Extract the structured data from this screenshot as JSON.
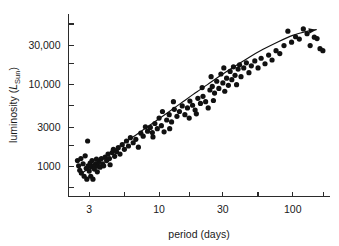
{
  "chart_data": {
    "type": "scatter",
    "title": "",
    "xlabel": "period (days)",
    "ylabel": "luminosity (L_Sun)",
    "ylabel_parts": {
      "prefix": "luminosity (",
      "symbol": "L",
      "subscript": "Sun",
      "suffix": ")"
    },
    "xscale": "log",
    "yscale": "log",
    "xlim": [
      2.1,
      190
    ],
    "ylim": [
      430,
      74000
    ],
    "grid": false,
    "legend": null,
    "xticks": [
      3,
      10,
      30,
      100
    ],
    "xtick_labels": [
      "3",
      "10",
      "30",
      "100"
    ],
    "xminor_ticks": [
      5.5,
      17,
      55,
      170
    ],
    "yticks": [
      1000,
      3000,
      10000,
      30000
    ],
    "ytick_labels": [
      "1000",
      "3000",
      "10,000",
      "30,000"
    ],
    "yminor_ticks": [
      550,
      1800,
      5500,
      18000,
      55000
    ],
    "marker": "filled-circle",
    "marker_color": "#111111",
    "marker_radius_px": 2.6,
    "annotation": "period-luminosity relation for Cepheid variable stars",
    "fit_curve": {
      "style": "solid-line-with-arrowhead",
      "color": "#111111",
      "points": [
        [
          2.55,
          800
        ],
        [
          3.0,
          950
        ],
        [
          3.6,
          1180
        ],
        [
          4.4,
          1500
        ],
        [
          5.5,
          1950
        ],
        [
          7.0,
          2550
        ],
        [
          9.0,
          3400
        ],
        [
          11.5,
          4500
        ],
        [
          14.5,
          5900
        ],
        [
          18.0,
          7600
        ],
        [
          23.0,
          10000
        ],
        [
          29.0,
          13000
        ],
        [
          37.0,
          16800
        ],
        [
          47.0,
          21500
        ],
        [
          60.0,
          27000
        ],
        [
          78.0,
          33500
        ],
        [
          100.0,
          40000
        ],
        [
          125.0,
          44500
        ],
        [
          150.0,
          47000
        ]
      ]
    },
    "points": [
      [
        2.45,
        1180
      ],
      [
        2.5,
        1020
      ],
      [
        2.55,
        900
      ],
      [
        2.6,
        1250
      ],
      [
        2.62,
        830
      ],
      [
        2.7,
        1080
      ],
      [
        2.75,
        760
      ],
      [
        2.8,
        1350
      ],
      [
        2.85,
        950
      ],
      [
        2.88,
        700
      ],
      [
        2.92,
        2050
      ],
      [
        2.95,
        1020
      ],
      [
        3.0,
        880
      ],
      [
        3.05,
        1100
      ],
      [
        3.08,
        760
      ],
      [
        3.12,
        990
      ],
      [
        3.15,
        1180
      ],
      [
        3.2,
        700
      ],
      [
        3.25,
        1020
      ],
      [
        3.28,
        930
      ],
      [
        3.35,
        1080
      ],
      [
        3.4,
        1230
      ],
      [
        3.45,
        860
      ],
      [
        3.5,
        1010
      ],
      [
        3.55,
        1150
      ],
      [
        3.62,
        980
      ],
      [
        3.7,
        1250
      ],
      [
        3.78,
        1080
      ],
      [
        3.85,
        1020
      ],
      [
        3.95,
        1300
      ],
      [
        4.05,
        1180
      ],
      [
        4.15,
        1420
      ],
      [
        4.25,
        1250
      ],
      [
        4.3,
        1050
      ],
      [
        4.45,
        1480
      ],
      [
        4.55,
        1620
      ],
      [
        4.65,
        1330
      ],
      [
        4.8,
        1520
      ],
      [
        4.95,
        1700
      ],
      [
        5.1,
        1420
      ],
      [
        5.3,
        1850
      ],
      [
        5.5,
        1620
      ],
      [
        5.7,
        2050
      ],
      [
        5.9,
        1780
      ],
      [
        6.1,
        2250
      ],
      [
        6.4,
        1950
      ],
      [
        6.7,
        2150
      ],
      [
        7.0,
        1720
      ],
      [
        7.3,
        2550
      ],
      [
        7.6,
        2350
      ],
      [
        7.9,
        3050
      ],
      [
        8.2,
        2700
      ],
      [
        8.6,
        3000
      ],
      [
        8.9,
        2600
      ],
      [
        9.3,
        3350
      ],
      [
        9.7,
        2900
      ],
      [
        10.0,
        3900
      ],
      [
        10.4,
        3150
      ],
      [
        10.9,
        2650
      ],
      [
        11.4,
        3700
      ],
      [
        11.9,
        4300
      ],
      [
        12.4,
        3500
      ],
      [
        13.0,
        5000
      ],
      [
        13.6,
        4100
      ],
      [
        14.2,
        4700
      ],
      [
        14.9,
        5500
      ],
      [
        15.6,
        4300
      ],
      [
        16.3,
        5200
      ],
      [
        17.0,
        6300
      ],
      [
        17.8,
        5600
      ],
      [
        18.6,
        4900
      ],
      [
        19.5,
        6800
      ],
      [
        20.4,
        5900
      ],
      [
        21.3,
        7200
      ],
      [
        22.3,
        6200
      ],
      [
        23.3,
        5200
      ],
      [
        24.0,
        8600
      ],
      [
        24.5,
        12500
      ],
      [
        25.0,
        9500
      ],
      [
        26.0,
        7900
      ],
      [
        27.0,
        11000
      ],
      [
        28.0,
        9000
      ],
      [
        29.0,
        13500
      ],
      [
        30.0,
        10500
      ],
      [
        31.0,
        8300
      ],
      [
        32.0,
        12000
      ],
      [
        33.0,
        9800
      ],
      [
        34.0,
        14500
      ],
      [
        35.0,
        11500
      ],
      [
        36.0,
        16500
      ],
      [
        37.0,
        13000
      ],
      [
        38.0,
        10000
      ],
      [
        39.0,
        15500
      ],
      [
        40.0,
        17500
      ],
      [
        41.0,
        12500
      ],
      [
        43.0,
        16000
      ],
      [
        45.0,
        18500
      ],
      [
        47.0,
        14000
      ],
      [
        49.0,
        17000
      ],
      [
        52.0,
        19500
      ],
      [
        55.0,
        16000
      ],
      [
        58.0,
        21000
      ],
      [
        62.0,
        18000
      ],
      [
        66.0,
        23000
      ],
      [
        70.0,
        20000
      ],
      [
        75.0,
        26000
      ],
      [
        80.0,
        24000
      ],
      [
        86.0,
        30000
      ],
      [
        92.0,
        45000
      ],
      [
        98.0,
        33000
      ],
      [
        105.0,
        38500
      ],
      [
        112.0,
        36000
      ],
      [
        120.0,
        48000
      ],
      [
        128.0,
        42000
      ],
      [
        135.0,
        30000
      ],
      [
        145.0,
        38000
      ],
      [
        152.0,
        36500
      ],
      [
        160.0,
        27500
      ],
      [
        168.0,
        26000
      ],
      [
        30.5,
        16000
      ],
      [
        25.5,
        6400
      ],
      [
        21.0,
        9200
      ],
      [
        19.0,
        4400
      ],
      [
        16.8,
        3900
      ],
      [
        12.8,
        6200
      ],
      [
        12.0,
        2900
      ],
      [
        10.6,
        4700
      ],
      [
        9.0,
        2300
      ]
    ]
  }
}
